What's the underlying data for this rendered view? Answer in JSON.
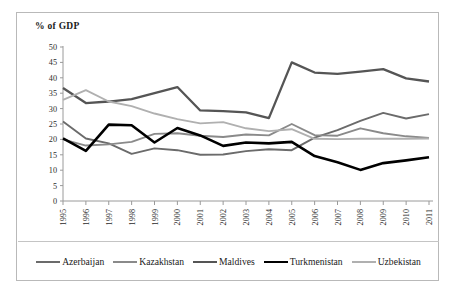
{
  "chart_data": {
    "type": "line",
    "title": "% of GDP",
    "xlabel": "",
    "ylabel": "% of GDP",
    "ylim": [
      0,
      50
    ],
    "ytick_step": 5,
    "yticks": [
      50,
      45,
      40,
      35,
      30,
      25,
      20,
      15,
      10,
      5,
      0
    ],
    "grid": false,
    "legend_position": "bottom",
    "categories": [
      "1995",
      "1996",
      "1997",
      "1998",
      "1999",
      "2000",
      "2001",
      "2002",
      "2003",
      "2004",
      "2005",
      "2006",
      "2007",
      "2008",
      "2009",
      "2010",
      "2011"
    ],
    "series": [
      {
        "name": "Azerbaijan",
        "color": "#6b6b6b",
        "width": 1.9,
        "values": [
          25.8,
          20.3,
          18.7,
          15.3,
          17.1,
          16.5,
          15.0,
          15.1,
          16.2,
          16.8,
          16.5,
          20.6,
          23.0,
          26.0,
          28.6,
          26.8,
          28.2
        ]
      },
      {
        "name": "Kazakhstan",
        "color": "#8a8a8a",
        "width": 1.9,
        "values": [
          20.0,
          18.0,
          18.4,
          19.2,
          21.8,
          22.0,
          21.2,
          20.8,
          21.6,
          21.3,
          25.0,
          21.4,
          21.2,
          23.6,
          22.0,
          21.0,
          20.5
        ]
      },
      {
        "name": "Maldives",
        "color": "#555555",
        "width": 2.3,
        "values": [
          36.7,
          31.8,
          32.3,
          33.1,
          35.0,
          37.0,
          29.4,
          29.2,
          28.8,
          26.9,
          45.0,
          41.7,
          41.3,
          42.0,
          42.8,
          39.8,
          38.8
        ]
      },
      {
        "name": "Turkmenistan",
        "color": "#000000",
        "width": 2.6,
        "values": [
          20.3,
          16.3,
          24.8,
          24.6,
          19.0,
          23.7,
          21.3,
          17.9,
          19.0,
          18.7,
          19.2,
          14.6,
          12.6,
          10.1,
          12.3,
          13.2,
          14.2
        ]
      },
      {
        "name": "Uzbekistan",
        "color": "#b0b0b0",
        "width": 1.9,
        "values": [
          32.8,
          36.0,
          32.3,
          30.8,
          28.4,
          26.6,
          25.2,
          25.6,
          23.6,
          22.7,
          23.3,
          20.2,
          20.1,
          20.2,
          20.2,
          20.2,
          20.3
        ]
      }
    ]
  },
  "legend": {
    "items": [
      {
        "label": "Azerbaijan"
      },
      {
        "label": "Kazakhstan"
      },
      {
        "label": "Maldives"
      },
      {
        "label": "Turkmenistan"
      },
      {
        "label": "Uzbekistan"
      }
    ]
  }
}
